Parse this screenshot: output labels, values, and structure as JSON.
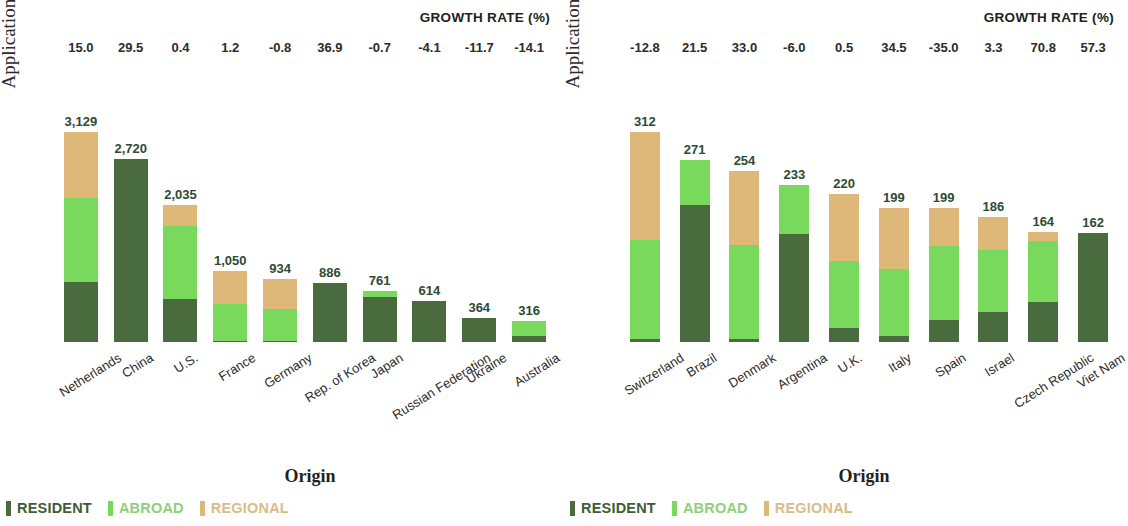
{
  "colors": {
    "resident": "#4a6b3e",
    "abroad": "#79d95c",
    "regional": "#ddb878",
    "value_label": "#2d4a33",
    "text": "#231f1d"
  },
  "panels": [
    {
      "id": "left",
      "growth_title": "GROWTH RATE (%)",
      "ylabel": "Applications",
      "xlabel": "Origin",
      "legend": [
        {
          "key": "resident",
          "label": "RESIDENT"
        },
        {
          "key": "abroad",
          "label": "ABROAD"
        },
        {
          "key": "regional",
          "label": "REGIONAL"
        }
      ],
      "chart_data": {
        "type": "bar",
        "subtype": "stacked-bar",
        "title": "",
        "xlabel": "Origin",
        "ylabel": "Applications",
        "ylim": [
          0,
          3129
        ],
        "grid": false,
        "legend_position": "bottom-left",
        "categories": [
          "Netherlands",
          "China",
          "U.S.",
          "France",
          "Germany",
          "Rep. of Korea",
          "Japan",
          "Russian Federation",
          "Ukraine",
          "Australia"
        ],
        "totals": [
          3129,
          2720,
          2035,
          1050,
          934,
          886,
          761,
          614,
          364,
          316
        ],
        "total_labels": [
          "3,129",
          "2,720",
          "2,035",
          "1,050",
          "934",
          "886",
          "761",
          "614",
          "364",
          "316"
        ],
        "growth_rate_labels": [
          "15.0",
          "29.5",
          "0.4",
          "1.2",
          "-0.8",
          "36.9",
          "-0.7",
          "-4.1",
          "-11.7",
          "-14.1"
        ],
        "growth_rates": [
          15.0,
          29.5,
          0.4,
          1.2,
          -0.8,
          36.9,
          -0.7,
          -4.1,
          -11.7,
          -14.1
        ],
        "series": [
          {
            "name": "RESIDENT",
            "key": "resident",
            "values": [
              900,
              2720,
              640,
              18,
              14,
              886,
              670,
              614,
              364,
              88
            ]
          },
          {
            "name": "ABROAD",
            "key": "abroad",
            "values": [
              1240,
              0,
              1090,
              540,
              470,
              0,
              91,
              0,
              0,
              228
            ]
          },
          {
            "name": "REGIONAL",
            "key": "regional",
            "values": [
              989,
              0,
              305,
              492,
              450,
              0,
              0,
              0,
              0,
              0
            ]
          }
        ]
      }
    },
    {
      "id": "right",
      "growth_title": "GROWTH RATE (%)",
      "ylabel": "Applications",
      "xlabel": "Origin",
      "legend": [
        {
          "key": "resident",
          "label": "RESIDENT"
        },
        {
          "key": "abroad",
          "label": "ABROAD"
        },
        {
          "key": "regional",
          "label": "REGIONAL"
        }
      ],
      "chart_data": {
        "type": "bar",
        "subtype": "stacked-bar",
        "title": "",
        "xlabel": "Origin",
        "ylabel": "Applications",
        "ylim": [
          0,
          312
        ],
        "grid": false,
        "legend_position": "bottom-left",
        "categories": [
          "Switzerland",
          "Brazil",
          "Denmark",
          "Argentina",
          "U.K.",
          "Italy",
          "Spain",
          "Israel",
          "Czech Republic",
          "Viet Nam"
        ],
        "totals": [
          312,
          271,
          254,
          233,
          220,
          199,
          199,
          186,
          164,
          162
        ],
        "total_labels": [
          "312",
          "271",
          "254",
          "233",
          "220",
          "199",
          "199",
          "186",
          "164",
          "162"
        ],
        "growth_rate_labels": [
          "-12.8",
          "21.5",
          "33.0",
          "-6.0",
          "0.5",
          "34.5",
          "-35.0",
          "3.3",
          "70.8",
          "57.3"
        ],
        "growth_rates": [
          -12.8,
          21.5,
          33.0,
          -6.0,
          0.5,
          34.5,
          -35.0,
          3.3,
          70.8,
          57.3
        ],
        "series": [
          {
            "name": "RESIDENT",
            "key": "resident",
            "values": [
              5,
              203,
              5,
              161,
              21,
              9,
              32,
              44,
              60,
              162
            ]
          },
          {
            "name": "ABROAD",
            "key": "abroad",
            "values": [
              146,
              68,
              139,
              72,
              100,
              100,
              110,
              93,
              90,
              0
            ]
          },
          {
            "name": "REGIONAL",
            "key": "regional",
            "values": [
              161,
              0,
              110,
              0,
              99,
              90,
              57,
              49,
              14,
              0
            ]
          }
        ]
      }
    }
  ]
}
